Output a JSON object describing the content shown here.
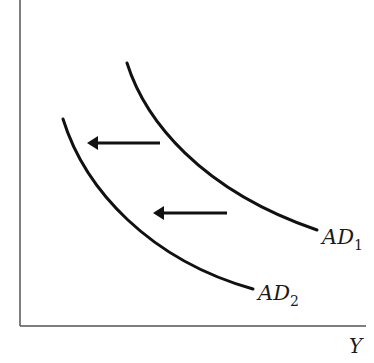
{
  "diagram": {
    "x_axis_label": "Y",
    "y_axis_label": "",
    "curves": [
      {
        "id": "AD1",
        "label_main": "AD",
        "label_sub": "1"
      },
      {
        "id": "AD2",
        "label_main": "AD",
        "label_sub": "2"
      }
    ],
    "arrows": [
      {
        "direction": "left",
        "meaning": "shift from AD1 to AD2"
      },
      {
        "direction": "left",
        "meaning": "shift from AD1 to AD2"
      }
    ],
    "colors": {
      "line": "#111111",
      "axis": "#555555",
      "background": "#ffffff"
    }
  }
}
